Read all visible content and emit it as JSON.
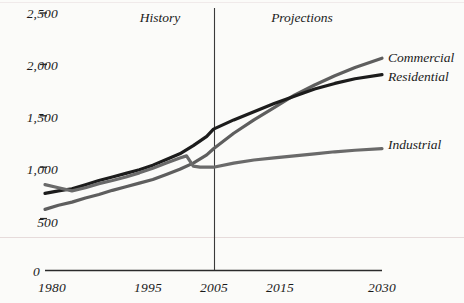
{
  "chart_data": {
    "type": "line",
    "title": "",
    "subtitle": "",
    "xlabel": "",
    "ylabel": "",
    "xlim": [
      1980,
      2030
    ],
    "ylim": [
      0,
      2500
    ],
    "grid": false,
    "legend_position": "right-inline-end-of-line",
    "x_ticks": [
      1980,
      1995,
      2005,
      2015,
      2030
    ],
    "x_tick_labels": [
      "1980",
      "1995",
      "2005",
      "2015",
      "2030"
    ],
    "y_ticks": [
      0,
      500,
      1000,
      1500,
      2000,
      2500
    ],
    "y_tick_labels": [
      "0",
      "500",
      "1,000",
      "1,500",
      "2,000",
      "2,500"
    ],
    "annotations": [
      {
        "name": "history",
        "text": "History",
        "x": 1997,
        "note": "label left of divider"
      },
      {
        "name": "projections",
        "text": "Projections",
        "x": 2018,
        "note": "label right of divider"
      },
      {
        "name": "divider",
        "text": "",
        "x": 2005,
        "note": "vertical rule separating history from projections"
      }
    ],
    "series": [
      {
        "name": "Commercial",
        "color": "#5e5e5e",
        "x": [
          1980,
          1982,
          1984,
          1986,
          1988,
          1990,
          1992,
          1994,
          1996,
          1998,
          2000,
          2002,
          2004,
          2005,
          2008,
          2011,
          2014,
          2017,
          2020,
          2023,
          2026,
          2030
        ],
        "values": [
          590,
          630,
          660,
          700,
          735,
          775,
          810,
          845,
          880,
          930,
          980,
          1040,
          1120,
          1180,
          1330,
          1460,
          1580,
          1700,
          1800,
          1890,
          1970,
          2060
        ]
      },
      {
        "name": "Residential",
        "color": "#1c1c1c",
        "x": [
          1980,
          1982,
          1984,
          1986,
          1988,
          1990,
          1992,
          1994,
          1996,
          1998,
          2000,
          2002,
          2004,
          2005,
          2008,
          2011,
          2014,
          2017,
          2020,
          2023,
          2026,
          2030
        ],
        "values": [
          745,
          770,
          790,
          830,
          870,
          905,
          940,
          975,
          1020,
          1075,
          1130,
          1210,
          1300,
          1370,
          1460,
          1540,
          1620,
          1690,
          1760,
          1815,
          1860,
          1900
        ]
      },
      {
        "name": "Industrial",
        "color": "#6a6a6a",
        "x": [
          1980,
          1982,
          1984,
          1986,
          1988,
          1990,
          1992,
          1994,
          1996,
          1998,
          2000,
          2001,
          2002,
          2003,
          2005,
          2008,
          2011,
          2014,
          2017,
          2020,
          2023,
          2026,
          2030
        ],
        "values": [
          830,
          800,
          770,
          800,
          840,
          870,
          905,
          945,
          990,
          1040,
          1090,
          1110,
          1010,
          1000,
          1000,
          1040,
          1070,
          1090,
          1110,
          1130,
          1150,
          1165,
          1180
        ]
      }
    ]
  },
  "labels": {
    "history": "History",
    "projections": "Projections",
    "commercial": "Commercial",
    "residential": "Residential",
    "industrial": "Industrial"
  },
  "y_axis": {
    "t0": "0",
    "t500": "500",
    "t1000": "1,000",
    "t1500": "1,500",
    "t2000": "2,000",
    "t2500": "2,500"
  },
  "x_axis": {
    "t1980": "1980",
    "t1995": "1995",
    "t2005": "2005",
    "t2015": "2015",
    "t2030": "2030"
  },
  "colors": {
    "commercial": "#5e5e5e",
    "residential": "#1c1c1c",
    "industrial": "#6a6a6a",
    "axis": "#2b2b2b",
    "background": "#fbfbf9"
  }
}
